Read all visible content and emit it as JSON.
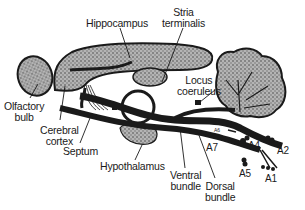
{
  "figure": {
    "labels": {
      "hippocampus": "Hippocampus",
      "stria_terminalis": [
        "Stria",
        "terminalis"
      ],
      "locus_coeruleus": [
        "Locus",
        "coeruleus"
      ],
      "olfactory_bulb": [
        "Olfactory",
        "bulb"
      ],
      "cerebral_cortex": [
        "Cerebral",
        "cortex"
      ],
      "septum": "Septum",
      "hypothalamus": "Hypothalamus",
      "ventral_bundle": [
        "Ventral",
        "bundle"
      ],
      "dorsal_bundle": [
        "Dorsal",
        "bundle"
      ],
      "a7": "A7",
      "a4": "A4",
      "a2": "A2",
      "a5": "A5",
      "a1": "A1",
      "a6": "A6"
    },
    "colors": {
      "ink": "#1a1a1a",
      "stipple": "#8a8a8a",
      "background": "#ffffff"
    }
  }
}
